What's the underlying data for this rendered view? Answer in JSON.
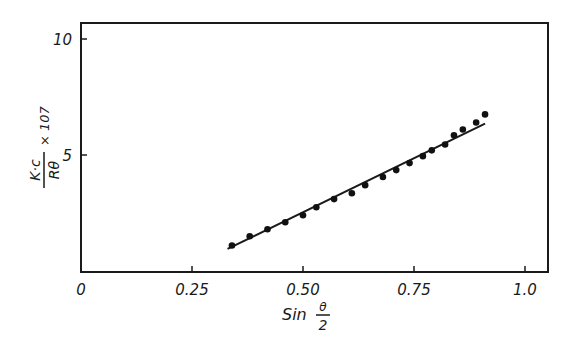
{
  "chart_data": {
    "type": "scatter",
    "title": "",
    "xlabel": "Sin θ/2",
    "ylabel": "K·c / Rθ × 10^7",
    "xlabel_parts": {
      "prefix": "Sin",
      "numerator": "θ",
      "denominator": "2"
    },
    "ylabel_parts": {
      "numerator": "K·c",
      "denominator": "Rθ",
      "suffix": "× 107"
    },
    "xlim": [
      0,
      1.05
    ],
    "ylim": [
      0,
      10.7
    ],
    "x_ticks": [
      0,
      0.25,
      0.5,
      0.75,
      1.0
    ],
    "x_tick_labels": [
      "0",
      "0.25",
      "0.50",
      "0.75",
      "1.0"
    ],
    "y_ticks": [
      5,
      10
    ],
    "y_tick_labels": [
      "5",
      "10"
    ],
    "grid": false,
    "legend": null,
    "series": [
      {
        "name": "measured",
        "kind": "points",
        "x": [
          0.34,
          0.38,
          0.42,
          0.46,
          0.5,
          0.53,
          0.57,
          0.61,
          0.64,
          0.68,
          0.71,
          0.74,
          0.77,
          0.79,
          0.82,
          0.84,
          0.86,
          0.89,
          0.91
        ],
        "y": [
          1.1,
          1.5,
          1.8,
          2.1,
          2.4,
          2.75,
          3.1,
          3.35,
          3.7,
          4.05,
          4.35,
          4.65,
          4.95,
          5.2,
          5.45,
          5.85,
          6.1,
          6.4,
          6.75
        ]
      },
      {
        "name": "linear fit",
        "kind": "line",
        "x": [
          0.33,
          0.91
        ],
        "y": [
          0.95,
          6.35
        ]
      }
    ]
  }
}
